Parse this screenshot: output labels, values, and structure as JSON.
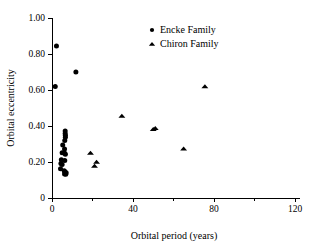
{
  "chart_data": {
    "type": "scatter",
    "title": "",
    "xlabel": "Orbital period (years)",
    "ylabel": "Orbital eccentricity",
    "xlim": [
      0,
      120
    ],
    "ylim": [
      0,
      1.0
    ],
    "xticks": [
      0,
      40,
      80,
      120
    ],
    "xtick_labels": [
      "0",
      "40",
      "80",
      "120"
    ],
    "xminor_ticks": [
      20,
      60,
      100
    ],
    "yticks": [
      0,
      0.2,
      0.4,
      0.6,
      0.8,
      1.0
    ],
    "ytick_labels": [
      "0",
      "0.20",
      "0.40",
      "0.60",
      "0.80",
      "1.00"
    ],
    "grid": false,
    "legend_position": "top-center",
    "series": [
      {
        "name": "Encke Family",
        "marker": "circle",
        "color": "#000000",
        "points": [
          [
            2.2,
            0.845
          ],
          [
            1.6,
            0.62
          ],
          [
            11.8,
            0.7
          ],
          [
            6.5,
            0.372
          ],
          [
            6.5,
            0.358
          ],
          [
            6.6,
            0.348
          ],
          [
            6.6,
            0.338
          ],
          [
            6.3,
            0.32
          ],
          [
            5.3,
            0.295
          ],
          [
            6.2,
            0.272
          ],
          [
            5.0,
            0.252
          ],
          [
            6.3,
            0.248
          ],
          [
            6.6,
            0.243
          ],
          [
            4.6,
            0.212
          ],
          [
            6.3,
            0.208
          ],
          [
            4.4,
            0.192
          ],
          [
            5.0,
            0.186
          ],
          [
            4.2,
            0.162
          ],
          [
            6.0,
            0.152
          ],
          [
            6.4,
            0.146
          ],
          [
            7.0,
            0.14
          ],
          [
            6.2,
            0.134
          ],
          [
            6.8,
            0.132
          ]
        ]
      },
      {
        "name": "Chiron Family",
        "marker": "triangle",
        "color": "#000000",
        "points": [
          [
            19.0,
            0.25
          ],
          [
            21.0,
            0.178
          ],
          [
            22.0,
            0.2
          ],
          [
            34.5,
            0.456
          ],
          [
            50.0,
            0.382
          ],
          [
            51.0,
            0.388
          ],
          [
            65.0,
            0.274
          ],
          [
            75.5,
            0.62
          ]
        ]
      }
    ]
  },
  "legend": {
    "entries": [
      {
        "label": "Encke Family",
        "marker": "circle"
      },
      {
        "label": "Chiron Family",
        "marker": "triangle"
      }
    ]
  }
}
